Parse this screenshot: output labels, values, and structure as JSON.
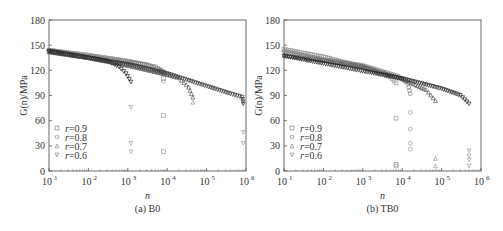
{
  "chart_data": [
    {
      "type": "scatter",
      "panel_label": "(a) B0",
      "xlabel": "n",
      "ylabel": "G(n)/MPa",
      "xscale": "log",
      "xlim": [
        10,
        1000000
      ],
      "ylim": [
        0,
        180
      ],
      "yticks": [
        0,
        30,
        60,
        90,
        120,
        150,
        180
      ],
      "xticks": [
        "10^1",
        "10^2",
        "10^3",
        "10^4",
        "10^5",
        "10^6"
      ],
      "legend_position": "bottom-left",
      "series": [
        {
          "name": "r=0.9",
          "marker": "square",
          "points": [
            [
              10,
              144
            ],
            [
              100,
              138
            ],
            [
              1000,
              131
            ],
            [
              5000,
              124
            ],
            [
              8000,
              118
            ]
          ],
          "outliers": [
            [
              8000,
              110
            ],
            [
              8000,
              66
            ],
            [
              8000,
              23
            ]
          ]
        },
        {
          "name": "r=0.8",
          "marker": "circle",
          "points": [
            [
              10,
              143
            ],
            [
              100,
              137
            ],
            [
              1000,
              130
            ],
            [
              3000,
              127
            ],
            [
              6000,
              121
            ],
            [
              8000,
              118
            ]
          ],
          "outliers": [
            [
              8000,
              107
            ]
          ]
        },
        {
          "name": "r=0.7",
          "marker": "triangle-up",
          "points": [
            [
              10,
              142
            ],
            [
              100,
              135
            ],
            [
              1000,
              126
            ],
            [
              10000,
              115
            ],
            [
              20000,
              111
            ],
            [
              35000,
              100
            ],
            [
              45000,
              88
            ]
          ],
          "outliers": [
            [
              45000,
              82
            ]
          ]
        },
        {
          "name": "r=0.6",
          "marker": "triangle-down",
          "points": [
            [
              10,
              143
            ],
            [
              100,
              135
            ],
            [
              300,
              131
            ],
            [
              600,
              124
            ],
            [
              900,
              116
            ],
            [
              1200,
              106
            ]
          ],
          "outliers": [
            [
              1200,
              76
            ],
            [
              1200,
              33
            ],
            [
              1200,
              23
            ]
          ]
        },
        {
          "name": "r=0.6-long",
          "marker": "triangle-down",
          "legend": false,
          "points": [
            [
              10,
              142
            ],
            [
              1000,
              127
            ],
            [
              10000,
              116
            ],
            [
              100000,
              101
            ],
            [
              400000,
              92
            ],
            [
              800000,
              88
            ],
            [
              850000,
              80
            ]
          ],
          "outliers": [
            [
              850000,
              46
            ],
            [
              850000,
              33
            ]
          ]
        }
      ]
    },
    {
      "type": "scatter",
      "panel_label": "(b) TB0",
      "xlabel": "n",
      "ylabel": "G(n)/MPa",
      "xscale": "log",
      "xlim": [
        10,
        1000000
      ],
      "ylim": [
        0,
        180
      ],
      "yticks": [
        0,
        30,
        60,
        90,
        120,
        150,
        180
      ],
      "xticks": [
        "10^1",
        "10^2",
        "10^3",
        "10^4",
        "10^5",
        "10^6"
      ],
      "legend_position": "bottom-left",
      "series": [
        {
          "name": "r=0.9",
          "marker": "square",
          "points": [
            [
              10,
              145
            ],
            [
              100,
              136
            ],
            [
              1000,
              124
            ],
            [
              5000,
              112
            ],
            [
              7000,
              105
            ]
          ],
          "outliers": [
            [
              7000,
              63
            ],
            [
              7000,
              8
            ],
            [
              7000,
              6
            ]
          ]
        },
        {
          "name": "r=0.8",
          "marker": "circle",
          "points": [
            [
              10,
              143
            ],
            [
              100,
              133
            ],
            [
              1000,
              126
            ],
            [
              8000,
              113
            ],
            [
              14000,
              104
            ],
            [
              16000,
              92
            ]
          ],
          "outliers": [
            [
              16000,
              70
            ],
            [
              16000,
              50
            ],
            [
              16000,
              33
            ],
            [
              16000,
              26
            ]
          ]
        },
        {
          "name": "r=0.7",
          "marker": "triangle-up",
          "points": [
            [
              10,
              138
            ],
            [
              100,
              132
            ],
            [
              1000,
              125
            ],
            [
              10000,
              110
            ],
            [
              40000,
              97
            ],
            [
              70000,
              84
            ]
          ],
          "outliers": [
            [
              70000,
              15
            ],
            [
              70000,
              6
            ]
          ]
        },
        {
          "name": "r=0.6",
          "marker": "triangle-down",
          "points": [
            [
              10,
              137
            ],
            [
              100,
              128
            ],
            [
              1000,
              119
            ],
            [
              10000,
              110
            ],
            [
              100000,
              98
            ],
            [
              300000,
              90
            ],
            [
              500000,
              80
            ]
          ],
          "outliers": [
            [
              500000,
              24
            ],
            [
              500000,
              18
            ],
            [
              500000,
              13
            ],
            [
              500000,
              6
            ]
          ]
        }
      ]
    }
  ]
}
